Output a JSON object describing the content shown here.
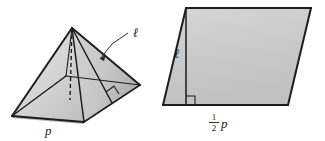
{
  "figure": {
    "background_color": "#ffffff",
    "line_color": "#1d1d1d",
    "fill_light": "#e2e2e2",
    "fill_mid": "#cccccc",
    "fill_dark": "#b4b4b4",
    "fill_base": "#c4c4c4"
  },
  "pyramid": {
    "name": "square-pyramid",
    "labels": {
      "slant_height": "ℓ",
      "base_perimeter": "p"
    },
    "markers": {
      "right_angle": "right-angle-marker",
      "altitude": "dashed-altitude"
    },
    "geometry": {
      "apex": [
        72,
        28
      ],
      "base_left": [
        12,
        116
      ],
      "base_front": [
        84,
        122
      ],
      "base_right": [
        140,
        85
      ],
      "base_back": [
        66,
        76
      ],
      "right_angle_foot": [
        112,
        78
      ]
    }
  },
  "parallelogram": {
    "name": "equivalent-parallelogram",
    "labels": {
      "height": "ℓ",
      "base_numerator": "1",
      "base_denominator": "2",
      "base_variable": "p"
    },
    "markers": {
      "right_angle": "right-angle-marker",
      "height_line": "height-segment"
    },
    "geometry": {
      "top_left": [
        186,
        8
      ],
      "top_right": [
        311,
        8
      ],
      "bottom_right": [
        288,
        105
      ],
      "bottom_left": [
        163,
        105
      ],
      "height_foot": [
        186,
        105
      ]
    }
  }
}
